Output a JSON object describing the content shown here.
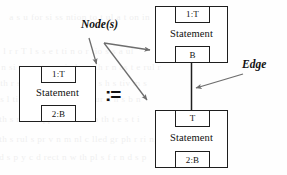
{
  "diagram": {
    "assignment_symbol": ":=",
    "annotations": {
      "nodes_label": "Node(s)",
      "edge_label": "Edge"
    },
    "lhs": {
      "node": {
        "top_slot": "1:T",
        "center_label": "Statement",
        "bottom_slot": "2:B"
      }
    },
    "rhs": {
      "top_node": {
        "top_slot": "1:T",
        "center_label": "Statement",
        "bottom_slot": "B"
      },
      "bottom_node": {
        "top_slot": "T",
        "center_label": "Statement",
        "bottom_slot": "2:B"
      },
      "edge": {
        "from": "top_node",
        "to": "bottom_node",
        "style": "solid-vertical"
      }
    },
    "colors": {
      "ink": "#1e1e1e",
      "arrow": "#6d6d6d",
      "paper": "#fefefe"
    },
    "bleed_text": [
      "a  s u  for  si   ss     ntion  to  t      ul a      t on  in",
      "  l  r  r  T  l  s  s  e  t  ti  n  o  r    tio  s  s  a  ul",
      "n  si t  on  at  s  rmi  al  s  u  th  r  n  as  t  e  rul  r",
      "th  r  suit  n  pp  in  o  s  ar  b  s  h  s  tiv  m  s",
      "s  l  ti  s  nt  b   form  ti n   m   ur  d    h  s  b  n",
      "th  s  r  t  o  s  ppl  nti  r  d n  o  th  t  e  s  t  i",
      "th  s  rul  s  pr  v  n  m  nl  c  lled  gr  ph  r  ri  ng",
      "d  s  p  y  c  d  rect  n  w  th  pl  s  f  r  n  d  s  p"
    ]
  }
}
